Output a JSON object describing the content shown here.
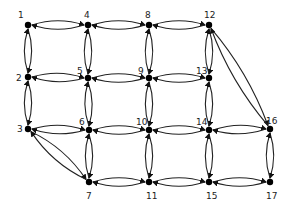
{
  "diagram": {
    "type": "directed-graph",
    "nodes": [
      {
        "id": "1",
        "label": "1",
        "x": 28,
        "y": 25,
        "lx": 18,
        "ly": 15
      },
      {
        "id": "4",
        "label": "4",
        "x": 88,
        "y": 25,
        "lx": 84,
        "ly": 15
      },
      {
        "id": "8",
        "label": "8",
        "x": 149,
        "y": 25,
        "lx": 145,
        "ly": 15
      },
      {
        "id": "12",
        "label": "12",
        "x": 209,
        "y": 25,
        "lx": 204,
        "ly": 15
      },
      {
        "id": "2",
        "label": "2",
        "x": 28,
        "y": 77,
        "lx": 16,
        "ly": 78
      },
      {
        "id": "5",
        "label": "5",
        "x": 88,
        "y": 78,
        "lx": 77,
        "ly": 71
      },
      {
        "id": "9",
        "label": "9",
        "x": 149,
        "y": 78,
        "lx": 138,
        "ly": 71
      },
      {
        "id": "13",
        "label": "13",
        "x": 209,
        "y": 78,
        "lx": 196,
        "ly": 71
      },
      {
        "id": "3",
        "label": "3",
        "x": 28,
        "y": 129,
        "lx": 17,
        "ly": 129
      },
      {
        "id": "6",
        "label": "6",
        "x": 89,
        "y": 130,
        "lx": 79,
        "ly": 122
      },
      {
        "id": "10",
        "label": "10",
        "x": 149,
        "y": 130,
        "lx": 136,
        "ly": 122
      },
      {
        "id": "14",
        "label": "14",
        "x": 209,
        "y": 130,
        "lx": 196,
        "ly": 122
      },
      {
        "id": "16",
        "label": "16",
        "x": 270,
        "y": 129,
        "lx": 266,
        "ly": 121
      },
      {
        "id": "7",
        "label": "7",
        "x": 89,
        "y": 182,
        "lx": 86,
        "ly": 196
      },
      {
        "id": "11",
        "label": "11",
        "x": 149,
        "y": 182,
        "lx": 146,
        "ly": 196
      },
      {
        "id": "15",
        "label": "15",
        "x": 209,
        "y": 182,
        "lx": 206,
        "ly": 196
      },
      {
        "id": "17",
        "label": "17",
        "x": 270,
        "y": 182,
        "lx": 266,
        "ly": 196
      }
    ],
    "edges": [
      [
        "1",
        "4"
      ],
      [
        "4",
        "1"
      ],
      [
        "4",
        "8"
      ],
      [
        "8",
        "4"
      ],
      [
        "8",
        "12"
      ],
      [
        "12",
        "8"
      ],
      [
        "2",
        "5"
      ],
      [
        "5",
        "2"
      ],
      [
        "5",
        "9"
      ],
      [
        "9",
        "5"
      ],
      [
        "9",
        "13"
      ],
      [
        "13",
        "9"
      ],
      [
        "3",
        "6"
      ],
      [
        "6",
        "3"
      ],
      [
        "6",
        "10"
      ],
      [
        "10",
        "6"
      ],
      [
        "10",
        "14"
      ],
      [
        "14",
        "10"
      ],
      [
        "14",
        "16"
      ],
      [
        "16",
        "14"
      ],
      [
        "7",
        "11"
      ],
      [
        "11",
        "7"
      ],
      [
        "11",
        "15"
      ],
      [
        "15",
        "11"
      ],
      [
        "15",
        "17"
      ],
      [
        "17",
        "15"
      ],
      [
        "1",
        "2"
      ],
      [
        "2",
        "1"
      ],
      [
        "2",
        "3"
      ],
      [
        "3",
        "2"
      ],
      [
        "4",
        "5"
      ],
      [
        "5",
        "4"
      ],
      [
        "5",
        "6"
      ],
      [
        "6",
        "5"
      ],
      [
        "6",
        "7"
      ],
      [
        "7",
        "6"
      ],
      [
        "8",
        "9"
      ],
      [
        "9",
        "8"
      ],
      [
        "9",
        "10"
      ],
      [
        "10",
        "9"
      ],
      [
        "10",
        "11"
      ],
      [
        "11",
        "10"
      ],
      [
        "12",
        "13"
      ],
      [
        "13",
        "12"
      ],
      [
        "13",
        "14"
      ],
      [
        "14",
        "13"
      ],
      [
        "14",
        "15"
      ],
      [
        "15",
        "14"
      ],
      [
        "16",
        "17"
      ],
      [
        "17",
        "16"
      ],
      [
        "3",
        "7"
      ],
      [
        "7",
        "3"
      ],
      [
        "12",
        "16"
      ],
      [
        "16",
        "12"
      ]
    ]
  }
}
